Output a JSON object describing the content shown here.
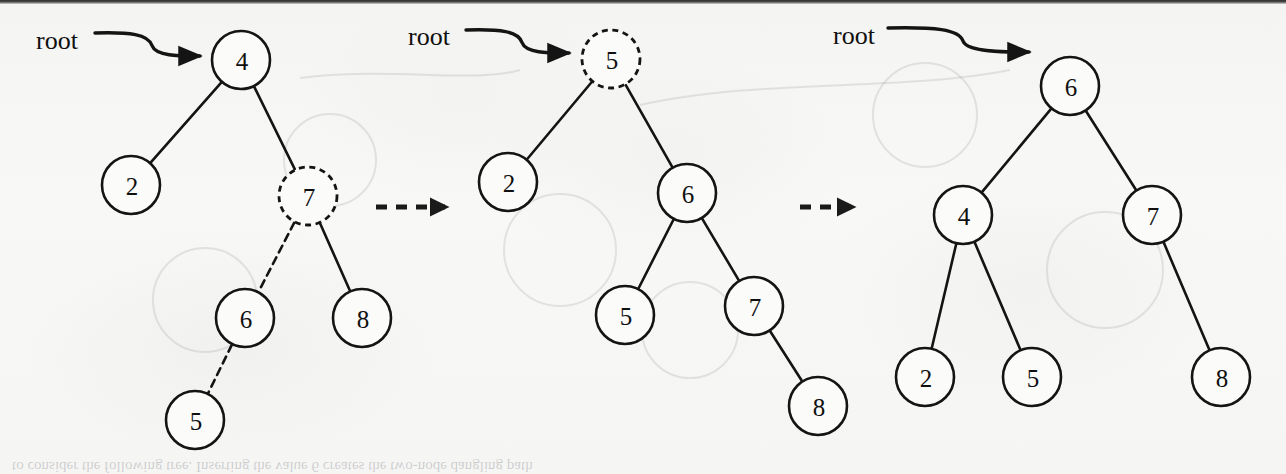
{
  "figure": {
    "kind": "binary-search-tree-insertion-sequence",
    "background_color": "#f6f6f5",
    "ink_color": "#141414",
    "panel_count": 3,
    "transition_arrow_label": ""
  },
  "panels": [
    {
      "id": "panel-before",
      "root_label": "root",
      "root_label_pos": {
        "x": 36,
        "y": 40
      },
      "pointer": {
        "from_x": 95,
        "from_y": 33,
        "to_x": 209,
        "to_y": 56
      },
      "nodes": [
        {
          "id": "n4",
          "label": "4",
          "x": 241,
          "y": 60,
          "style": "solid",
          "r": 29
        },
        {
          "id": "n2",
          "label": "2",
          "x": 131,
          "y": 185,
          "style": "solid",
          "r": 29
        },
        {
          "id": "n7",
          "label": "7",
          "x": 308,
          "y": 196,
          "style": "dashed",
          "r": 29
        },
        {
          "id": "n6",
          "label": "6",
          "x": 245,
          "y": 318,
          "style": "solid",
          "r": 29
        },
        {
          "id": "n8",
          "label": "8",
          "x": 362,
          "y": 318,
          "style": "solid",
          "r": 29
        },
        {
          "id": "n5",
          "label": "5",
          "x": 195,
          "y": 420,
          "style": "solid",
          "r": 29
        }
      ],
      "edges": [
        {
          "from": "n4",
          "to": "n2",
          "style": "solid"
        },
        {
          "from": "n4",
          "to": "n7",
          "style": "solid"
        },
        {
          "from": "n7",
          "to": "n6",
          "style": "dashed"
        },
        {
          "from": "n7",
          "to": "n8",
          "style": "solid"
        },
        {
          "from": "n6",
          "to": "n5",
          "style": "dashed"
        }
      ]
    },
    {
      "id": "panel-middle",
      "root_label": "root",
      "root_label_pos": {
        "x": 408,
        "y": 36
      },
      "pointer": {
        "from_x": 466,
        "from_y": 30,
        "to_x": 578,
        "to_y": 53
      },
      "nodes": [
        {
          "id": "m5r",
          "label": "5",
          "x": 611,
          "y": 59,
          "style": "dashed",
          "r": 29
        },
        {
          "id": "m2",
          "label": "2",
          "x": 508,
          "y": 182,
          "style": "solid",
          "r": 29
        },
        {
          "id": "m6",
          "label": "6",
          "x": 687,
          "y": 193,
          "style": "solid",
          "r": 29
        },
        {
          "id": "m5",
          "label": "5",
          "x": 625,
          "y": 315,
          "style": "solid",
          "r": 29
        },
        {
          "id": "m7",
          "label": "7",
          "x": 754,
          "y": 306,
          "style": "solid",
          "r": 29
        },
        {
          "id": "m8",
          "label": "8",
          "x": 818,
          "y": 406,
          "style": "solid",
          "r": 29
        }
      ],
      "edges": [
        {
          "from": "m5r",
          "to": "m2",
          "style": "solid"
        },
        {
          "from": "m5r",
          "to": "m6",
          "style": "solid"
        },
        {
          "from": "m6",
          "to": "m5",
          "style": "solid"
        },
        {
          "from": "m6",
          "to": "m7",
          "style": "solid"
        },
        {
          "from": "m7",
          "to": "m8",
          "style": "solid"
        }
      ]
    },
    {
      "id": "panel-after",
      "root_label": "root",
      "root_label_pos": {
        "x": 833,
        "y": 35
      },
      "pointer": {
        "from_x": 888,
        "from_y": 28,
        "to_x": 1038,
        "to_y": 52
      },
      "nodes": [
        {
          "id": "a6",
          "label": "6",
          "x": 1070,
          "y": 86,
          "style": "solid",
          "r": 29
        },
        {
          "id": "a4",
          "label": "4",
          "x": 963,
          "y": 215,
          "style": "solid",
          "r": 29
        },
        {
          "id": "a7",
          "label": "7",
          "x": 1152,
          "y": 215,
          "style": "solid",
          "r": 29
        },
        {
          "id": "a2",
          "label": "2",
          "x": 925,
          "y": 377,
          "style": "solid",
          "r": 29
        },
        {
          "id": "a5",
          "label": "5",
          "x": 1032,
          "y": 377,
          "style": "solid",
          "r": 29
        },
        {
          "id": "a8",
          "label": "8",
          "x": 1221,
          "y": 377,
          "style": "solid",
          "r": 29
        }
      ],
      "edges": [
        {
          "from": "a6",
          "to": "a4",
          "style": "solid"
        },
        {
          "from": "a6",
          "to": "a7",
          "style": "solid"
        },
        {
          "from": "a4",
          "to": "a2",
          "style": "solid"
        },
        {
          "from": "a4",
          "to": "a5",
          "style": "solid"
        },
        {
          "from": "a7",
          "to": "a8",
          "style": "solid"
        }
      ]
    }
  ],
  "transitions": [
    {
      "id": "transition-1",
      "from_x": 376,
      "to_x": 445,
      "y": 207
    },
    {
      "id": "transition-2",
      "from_x": 800,
      "to_x": 852,
      "y": 207
    }
  ],
  "bleed_through": {
    "note": "faint mirrored text showing through from the reverse side of the scanned page",
    "lines": [
      {
        "text": "to  consider  the  following  tree.  Inserting  the  value  6  creates  the  two-node  dangling  path",
        "x": 12,
        "y": 462
      }
    ]
  }
}
